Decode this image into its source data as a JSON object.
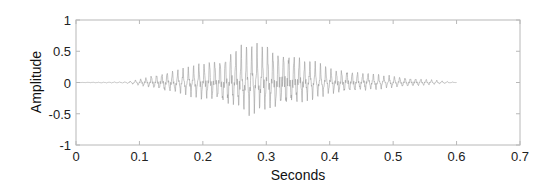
{
  "chart_data": {
    "type": "line",
    "title": "",
    "xlabel": "Seconds",
    "ylabel": "Amplitude",
    "xlim": [
      0,
      0.7
    ],
    "ylim": [
      -1,
      1
    ],
    "x_ticks": [
      "0",
      "0.1",
      "0.2",
      "0.3",
      "0.4",
      "0.5",
      "0.6",
      "0.7"
    ],
    "y_ticks": [
      "1",
      "0.5",
      "0",
      "-0.5",
      "-1"
    ],
    "grid": false,
    "legend": null,
    "series": [
      {
        "name": "waveform",
        "color": "#9a9a9a",
        "description": "speech-like oscillating waveform; silence 0-0.08s, builds from ~0.1s, peak envelope ~0.55 around 0.27s, decays to ~0 by 0.6s",
        "envelope": {
          "t": [
            0.0,
            0.08,
            0.1,
            0.12,
            0.15,
            0.18,
            0.2,
            0.23,
            0.25,
            0.27,
            0.3,
            0.33,
            0.35,
            0.38,
            0.4,
            0.43,
            0.45,
            0.5,
            0.55,
            0.57,
            0.6
          ],
          "pos": [
            0.0,
            0.01,
            0.05,
            0.1,
            0.17,
            0.22,
            0.28,
            0.36,
            0.48,
            0.56,
            0.52,
            0.44,
            0.36,
            0.27,
            0.2,
            0.17,
            0.14,
            0.09,
            0.05,
            0.03,
            0.0
          ],
          "neg": [
            0.0,
            -0.01,
            -0.04,
            -0.08,
            -0.13,
            -0.18,
            -0.22,
            -0.27,
            -0.36,
            -0.4,
            -0.37,
            -0.32,
            -0.26,
            -0.2,
            -0.16,
            -0.13,
            -0.11,
            -0.07,
            -0.04,
            -0.02,
            0.0
          ]
        }
      }
    ]
  },
  "colors": {
    "axis": "#b8b8b8",
    "waveform": "#9a9a9a",
    "text": "#222222"
  }
}
